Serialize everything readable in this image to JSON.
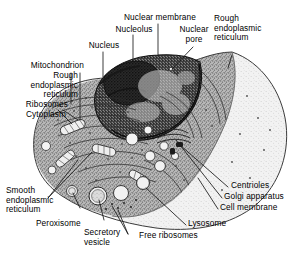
{
  "figure": {
    "background_color": "#ffffff",
    "text_color": "#000000",
    "leader_line_color": "#1a1a1a",
    "cytoplasm_color": "#9a9a9a",
    "outer_cytoplasm_color": "#e8e8e8",
    "nucleus_color": "#3a3a3a"
  },
  "labels": {
    "nucleus": "Nucleus",
    "nucleolus": "Nucleolus",
    "nuclear_membrane": "Nuclear membrane",
    "nuclear_pore": "Nuclear\npore",
    "rough_er_top": "Rough\nendoplasmic\nreticulum",
    "mitochondrion": "Mitochondrion",
    "rough_er_left": "Rough\nendoplasmic\nreticulum",
    "ribosomes": "Ribosomes",
    "cytoplasm": "Cytoplasm",
    "smooth_er": "Smooth\nendoplasmic\nreticulum",
    "peroxisome": "Peroxisome",
    "secretory_vesicle": "Secretory\nvesicle",
    "free_ribosomes": "Free ribosomes",
    "lysosome": "Lysosome",
    "centrioles": "Centrioles",
    "golgi_apparatus": "Golgi apparatus",
    "cell_membrane": "Cell membrane"
  }
}
